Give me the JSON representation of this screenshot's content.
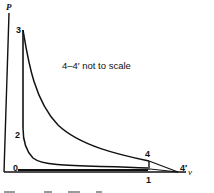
{
  "diagram": {
    "type": "P-v diagram",
    "axes": {
      "y_label": "P",
      "x_label": "v"
    },
    "points": [
      {
        "id": "0",
        "label": "0"
      },
      {
        "id": "1",
        "label": "1"
      },
      {
        "id": "2",
        "label": "2"
      },
      {
        "id": "3",
        "label": "3"
      },
      {
        "id": "4",
        "label": "4"
      },
      {
        "id": "4p",
        "label": "4′"
      }
    ],
    "annotation": "4–4′ not to scale",
    "colors": {
      "ink": "#111111",
      "background": "#ffffff"
    }
  }
}
